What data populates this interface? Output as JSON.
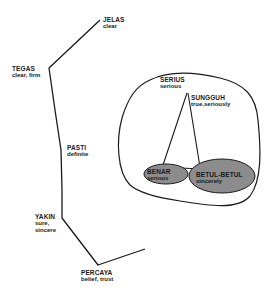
{
  "diagram": {
    "line_color": "#1a1a1a",
    "ellipse_fill": "#8c8c8c",
    "chain": [
      {
        "id": "jelas",
        "word": "JELAS",
        "gloss": "clear"
      },
      {
        "id": "tegas",
        "word": "TEGAS",
        "gloss": "clear, firm"
      },
      {
        "id": "pasti",
        "word": "PASTI",
        "gloss": "definite"
      },
      {
        "id": "yakin",
        "word": "YAKIN",
        "gloss_lines": [
          "sure,",
          "sincere"
        ]
      },
      {
        "id": "percaya",
        "word": "PERCAYA",
        "gloss": "belief, trust"
      }
    ],
    "cluster": [
      {
        "id": "serius",
        "word": "SERIUS",
        "gloss": "serious"
      },
      {
        "id": "sungguh",
        "word": "SUNGGUH",
        "gloss": "true,seriously"
      },
      {
        "id": "benar",
        "word": "BENAR",
        "gloss": "serious"
      },
      {
        "id": "betul-betul",
        "word": "BETUL-BETUL",
        "gloss": "sincerely"
      }
    ]
  }
}
